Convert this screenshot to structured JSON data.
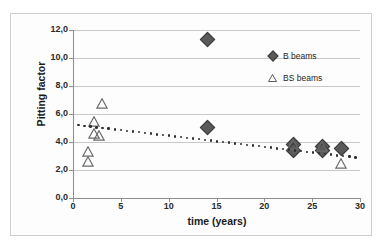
{
  "chart_data": {
    "type": "scatter",
    "title": "",
    "xlabel": "time (years)",
    "ylabel": "Pitting factor",
    "xlim": [
      0,
      30
    ],
    "ylim": [
      0,
      12
    ],
    "xticks": [
      "0",
      "5",
      "10",
      "15",
      "20",
      "25",
      "30"
    ],
    "xtick_values": [
      0,
      5,
      10,
      15,
      20,
      25,
      30
    ],
    "yticks": [
      "0,0",
      "2,0",
      "4,0",
      "6,0",
      "8,0",
      "10,0",
      "12,0"
    ],
    "ytick_values": [
      0,
      2,
      4,
      6,
      8,
      10,
      12
    ],
    "grid": "horizontal",
    "legend_position": "inside-top-right",
    "series": [
      {
        "name": "B beams",
        "marker": "filled-diamond",
        "color": "#5a5a5a",
        "points": [
          {
            "x": 14.0,
            "y": 11.35
          },
          {
            "x": 14.0,
            "y": 5.05
          },
          {
            "x": 23.0,
            "y": 3.85
          },
          {
            "x": 23.0,
            "y": 3.45
          },
          {
            "x": 26.0,
            "y": 3.75
          },
          {
            "x": 26.0,
            "y": 3.4
          },
          {
            "x": 28.0,
            "y": 3.55
          }
        ]
      },
      {
        "name": "BS beams",
        "marker": "open-triangle",
        "color": "#6a6a6a",
        "points": [
          {
            "x": 1.6,
            "y": 3.35
          },
          {
            "x": 1.6,
            "y": 2.6
          },
          {
            "x": 2.2,
            "y": 5.5
          },
          {
            "x": 2.2,
            "y": 4.6
          },
          {
            "x": 2.7,
            "y": 4.45
          },
          {
            "x": 3.0,
            "y": 6.75
          },
          {
            "x": 23.0,
            "y": 3.8
          },
          {
            "x": 26.0,
            "y": 3.7
          },
          {
            "x": 28.0,
            "y": 2.5
          }
        ]
      }
    ],
    "trendline": {
      "name": "dotted-trendline",
      "style": "dotted",
      "x_start": 0.6,
      "y_start": 5.2,
      "x_end": 29.5,
      "y_end": 2.9
    }
  },
  "legend": {
    "items": [
      {
        "label": "B beams",
        "marker": "filled-diamond"
      },
      {
        "label": "BS beams",
        "marker": "open-triangle"
      }
    ]
  },
  "axes": {
    "x_title": "time (years)",
    "y_title": "Pitting factor"
  }
}
